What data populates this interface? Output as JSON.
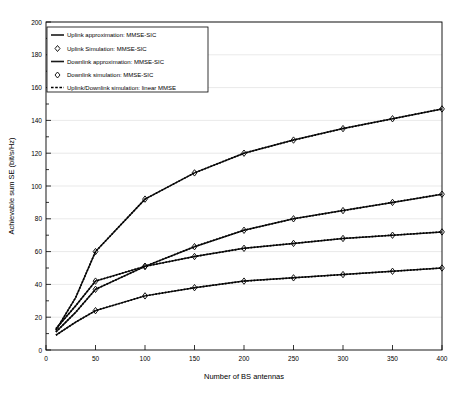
{
  "chart_data": {
    "type": "line",
    "title": "",
    "xlabel": "Number of BS antennas",
    "ylabel": "Achievable sum SE (bit/s/Hz)",
    "xlim": [
      0,
      400
    ],
    "ylim": [
      0,
      200
    ],
    "xticks": [
      "0",
      "50",
      "100",
      "150",
      "200",
      "250",
      "300",
      "350",
      "400"
    ],
    "yticks": [
      "0",
      "20",
      "40",
      "60",
      "80",
      "100",
      "120",
      "140",
      "160",
      "180",
      "200"
    ],
    "grid": true,
    "legend_position": "upper-left",
    "x": [
      10,
      20,
      30,
      50,
      100,
      150,
      200,
      250,
      300,
      350,
      400
    ],
    "series": [
      {
        "name": "Uplink approximation: MMSE-SIC",
        "style": "solid",
        "values": [
          13,
          20,
          27,
          42,
          51,
          57,
          62,
          65,
          68,
          70,
          72
        ]
      },
      {
        "name": "Uplink Simulation: MMSE-SIC",
        "style": "marker-diamond",
        "values": [
          13,
          20,
          27,
          42,
          51,
          57,
          62,
          65,
          68,
          70,
          72
        ]
      },
      {
        "name": "Downlink approximation: MMSE-SIC",
        "style": "solid",
        "values": [
          12,
          22,
          32,
          60,
          92,
          108,
          120,
          128,
          135,
          141,
          147
        ]
      },
      {
        "name": "Downlink simulation: MMSE-SIC",
        "style": "marker-diamond",
        "values": [
          12,
          22,
          32,
          60,
          92,
          108,
          120,
          128,
          135,
          141,
          147
        ]
      },
      {
        "name": "Uplink/Downlink simulation: linear MMSE",
        "style": "dashed",
        "values": [
          11,
          17,
          23,
          37,
          51,
          63,
          73,
          80,
          85,
          90,
          95
        ]
      },
      {
        "name": "Uplink/Downlink simulation: linear MMSE (lower)",
        "style": "dashed",
        "values": [
          9,
          13,
          17,
          24,
          33,
          38,
          42,
          44,
          46,
          48,
          50
        ]
      }
    ],
    "curves_plotted": [
      {
        "id": "downlink-mmse-sic",
        "label": "Downlink approximation: MMSE-SIC",
        "points": [
          [
            10,
            12
          ],
          [
            20,
            22
          ],
          [
            30,
            32
          ],
          [
            50,
            60
          ],
          [
            100,
            92
          ],
          [
            150,
            108
          ],
          [
            200,
            120
          ],
          [
            250,
            128
          ],
          [
            300,
            135
          ],
          [
            350,
            141
          ],
          [
            400,
            147
          ]
        ]
      },
      {
        "id": "linear-mmse-upper",
        "label": "Uplink/Downlink simulation: linear MMSE",
        "points": [
          [
            10,
            11
          ],
          [
            20,
            17
          ],
          [
            30,
            23
          ],
          [
            50,
            37
          ],
          [
            100,
            51
          ],
          [
            150,
            63
          ],
          [
            200,
            73
          ],
          [
            250,
            80
          ],
          [
            300,
            85
          ],
          [
            350,
            90
          ],
          [
            400,
            95
          ]
        ]
      },
      {
        "id": "uplink-mmse-sic",
        "label": "Uplink approximation: MMSE-SIC",
        "points": [
          [
            10,
            13
          ],
          [
            20,
            20
          ],
          [
            30,
            27
          ],
          [
            50,
            42
          ],
          [
            100,
            51
          ],
          [
            150,
            57
          ],
          [
            200,
            62
          ],
          [
            250,
            65
          ],
          [
            300,
            68
          ],
          [
            350,
            70
          ],
          [
            400,
            72
          ]
        ]
      },
      {
        "id": "linear-mmse-lower",
        "label": "Uplink/Downlink simulation: linear MMSE (lower)",
        "points": [
          [
            10,
            9
          ],
          [
            20,
            13
          ],
          [
            30,
            17
          ],
          [
            50,
            24
          ],
          [
            100,
            33
          ],
          [
            150,
            38
          ],
          [
            200,
            42
          ],
          [
            250,
            44
          ],
          [
            300,
            46
          ],
          [
            350,
            48
          ],
          [
            400,
            50
          ]
        ]
      }
    ],
    "marker_x": [
      50,
      100,
      150,
      200,
      250,
      300,
      350,
      400
    ]
  },
  "legend": {
    "items": [
      {
        "label": "Uplink approximation: MMSE-SIC",
        "glyph": "line-solid"
      },
      {
        "label": "Uplink Simulation: MMSE-SIC",
        "glyph": "diamond-marker"
      },
      {
        "label": "Downlink approximation: MMSE-SIC",
        "glyph": "line-solid"
      },
      {
        "label": "Downlink simulation: MMSE-SIC",
        "glyph": "diamond-marker"
      },
      {
        "label": "Uplink/Downlink simulation: linear MMSE",
        "glyph": "line-dashed"
      }
    ]
  },
  "axes": {
    "x_title": "Number of BS antennas",
    "y_title": "Achievable sum SE (bit/s/Hz)"
  }
}
